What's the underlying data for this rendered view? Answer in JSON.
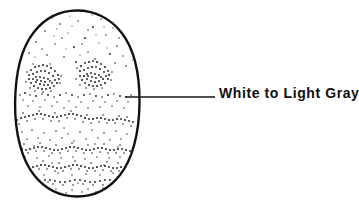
{
  "figure": {
    "type": "technical-line-illustration",
    "background_color": "#ffffff",
    "ink_color": "#111111",
    "canvas": {
      "width": 359,
      "height": 210
    }
  },
  "specimen": {
    "name": "stippled oval specimen",
    "shape": "oval",
    "bounds": {
      "x": 15,
      "y": 10,
      "width": 125,
      "height": 187
    },
    "center": {
      "cx": 77,
      "cy": 103
    },
    "radii": {
      "rx": 62,
      "ry": 93
    },
    "outline_color": "#111111",
    "outline_width": 2.4,
    "fill_color": "#ffffff",
    "texture": "stipple",
    "texture_description": "irregular hand-drawn stippling, dense dark clusters in upper middle and wavy horizontal dense bands across the lower half",
    "dense_clusters": [
      {
        "name": "upper-left-cluster",
        "cx": 44,
        "cy": 76,
        "rx": 18,
        "ry": 13
      },
      {
        "name": "upper-right-cluster",
        "cx": 95,
        "cy": 74,
        "rx": 17,
        "ry": 13
      }
    ],
    "banded_regions": [
      {
        "name": "band-upper",
        "y": 94,
        "density": "medium"
      },
      {
        "name": "band-mid",
        "y": 117,
        "density": "high"
      },
      {
        "name": "band-lower-1",
        "y": 148,
        "density": "high"
      },
      {
        "name": "band-lower-2",
        "y": 166,
        "density": "high"
      },
      {
        "name": "band-lower-3",
        "y": 181,
        "density": "medium"
      }
    ]
  },
  "callout": {
    "label": "White to Light Gray",
    "text_color": "#101010",
    "leader_line": {
      "color": "#141414",
      "width": 1.5,
      "x1": 125,
      "y1": 97,
      "x2": 215,
      "y2": 97
    },
    "anchor_point": {
      "x": 125,
      "y": 97
    },
    "text_position": {
      "x": 219,
      "y": 85
    }
  }
}
